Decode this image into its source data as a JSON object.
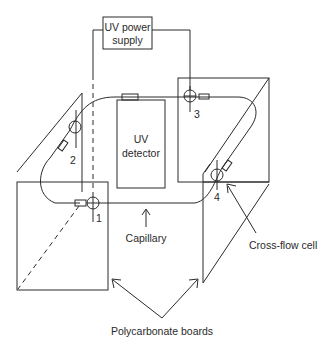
{
  "components": {
    "power_supply": {
      "line1": "UV power",
      "line2": "supply"
    },
    "detector": {
      "line1": "UV",
      "line2": "detector"
    }
  },
  "markers": [
    "1",
    "2",
    "3",
    "4"
  ],
  "labels": {
    "capillary": "Capillary",
    "cross_flow_cell": "Cross-flow cell",
    "polycarbonate_boards": "Polycarbonate boards"
  }
}
